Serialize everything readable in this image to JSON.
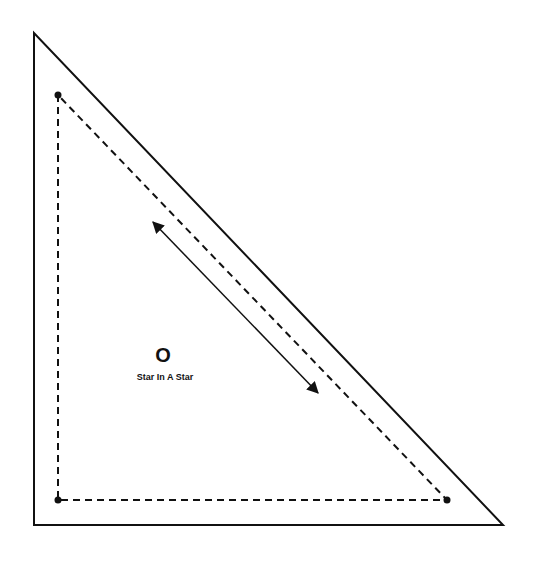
{
  "pattern": {
    "piece_letter": "O",
    "piece_name": "Star In A Star"
  },
  "colors": {
    "line": "#111111",
    "background": "#ffffff"
  },
  "shapes": {
    "outer_triangle": [
      [
        34,
        33
      ],
      [
        34,
        525
      ],
      [
        503,
        525
      ]
    ],
    "inner_dashed_triangle": [
      [
        58,
        95
      ],
      [
        58,
        500
      ],
      [
        447,
        500
      ]
    ],
    "grain_arrow": {
      "from": [
        153,
        222
      ],
      "to": [
        318,
        393
      ]
    }
  }
}
